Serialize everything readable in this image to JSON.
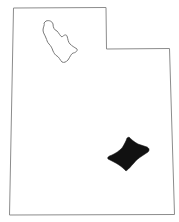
{
  "map": {
    "title": "Utah",
    "colors": {
      "background": "#ffffff",
      "outline": "#8c8c8c",
      "lake_outline": "#7a7a7a",
      "region_fill": "#111111"
    },
    "features": [
      {
        "name": "state-outline",
        "label": "Utah state boundary"
      },
      {
        "name": "great-salt-lake",
        "label": "Great Salt Lake (outline)"
      },
      {
        "name": "highlighted-region",
        "label": "Highlighted county region"
      }
    ]
  }
}
